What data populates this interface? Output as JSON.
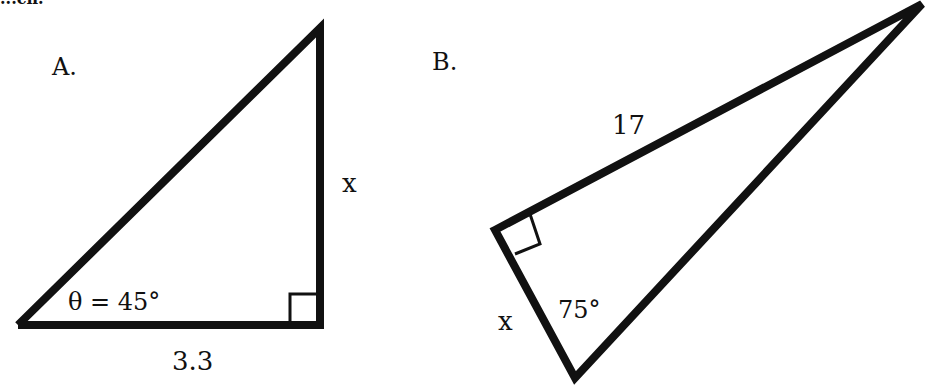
{
  "header": {
    "clipped_text": "...ch."
  },
  "diagram": {
    "stroke_color": "#111111",
    "background": "#ffffff",
    "triangles": [
      {
        "id": "A",
        "panel_label": "A.",
        "vertices": {
          "acute_left": [
            18,
            325
          ],
          "right_angle": [
            320,
            325
          ],
          "top": [
            320,
            28
          ]
        },
        "labels": {
          "angle": "θ = 45°",
          "base": "3.3",
          "vertical_side": "x"
        },
        "right_angle_marker": true
      },
      {
        "id": "B",
        "panel_label": "B.",
        "vertices": {
          "right_angle": [
            495,
            230
          ],
          "apex": [
            922,
            4
          ],
          "bottom": [
            575,
            378
          ]
        },
        "labels": {
          "hypotenuse_side": "17",
          "short_leg": "x",
          "angle": "75°"
        },
        "right_angle_marker": true
      }
    ]
  }
}
